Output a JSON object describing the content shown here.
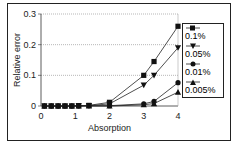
{
  "chart_data": {
    "type": "line",
    "title": "",
    "xlabel": "Absorption",
    "ylabel": "Relative error",
    "xlim": [
      0,
      4
    ],
    "ylim": [
      0,
      0.3
    ],
    "x_ticks": [
      "0",
      "1",
      "2",
      "3",
      "4"
    ],
    "y_ticks": [
      "0",
      "0.1",
      "0.2",
      "0.3"
    ],
    "grid": "horizontal",
    "legend_position": "right",
    "x": [
      0.1,
      0.3,
      0.5,
      0.7,
      0.9,
      1.1,
      1.4,
      2.0,
      3.0,
      3.3,
      4.0
    ],
    "series": [
      {
        "name": "0.1%",
        "marker": "square",
        "values": [
          0,
          0,
          0,
          0,
          0,
          0.001,
          0.002,
          0.012,
          0.1,
          0.145,
          0.26
        ]
      },
      {
        "name": "0.05%",
        "marker": "triangle-down",
        "values": [
          0,
          0,
          0,
          0,
          0,
          0.001,
          0.001,
          0.007,
          0.068,
          0.1,
          0.19
        ]
      },
      {
        "name": "0.01%",
        "marker": "circle",
        "values": [
          0,
          0,
          0,
          0,
          0,
          0,
          0.001,
          0.001,
          0.007,
          0.015,
          0.076
        ]
      },
      {
        "name": "0.005%",
        "marker": "triangle-up",
        "values": [
          0,
          0,
          0,
          0,
          0,
          0,
          0,
          0,
          0.004,
          0.008,
          0.045
        ]
      }
    ]
  }
}
